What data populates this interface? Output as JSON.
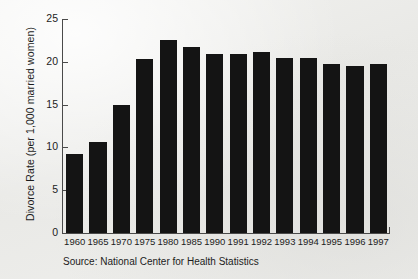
{
  "chart_data": {
    "type": "bar",
    "title": "",
    "subtitle": "",
    "xlabel": "",
    "ylabel": "Divorce Rate (per 1,000 married women)",
    "categories": [
      "1960",
      "1965",
      "1970",
      "1975",
      "1980",
      "1985",
      "1990",
      "1991",
      "1992",
      "1993",
      "1994",
      "1995",
      "1996",
      "1997"
    ],
    "values": [
      9.2,
      10.6,
      14.9,
      20.3,
      22.6,
      21.7,
      20.9,
      20.9,
      21.2,
      20.5,
      20.5,
      19.8,
      19.5,
      19.8
    ],
    "series": [
      {
        "name": "Divorce Rate",
        "values": [
          9.2,
          10.6,
          14.9,
          20.3,
          22.6,
          21.7,
          20.9,
          20.9,
          21.2,
          20.5,
          20.5,
          19.8,
          19.5,
          19.8
        ]
      }
    ],
    "ylim": [
      0,
      25
    ],
    "yticks": [
      "0",
      "5",
      "10",
      "15",
      "20",
      "25"
    ],
    "ytick_values": [
      0,
      5,
      10,
      15,
      20,
      25
    ],
    "grid": false,
    "legend": false,
    "legend_position": "none",
    "bar_color": "#141414",
    "background_color": "#edeeec",
    "axis_color": "#4a4a4a"
  },
  "source_note": "Source: National Center for Health Statistics"
}
